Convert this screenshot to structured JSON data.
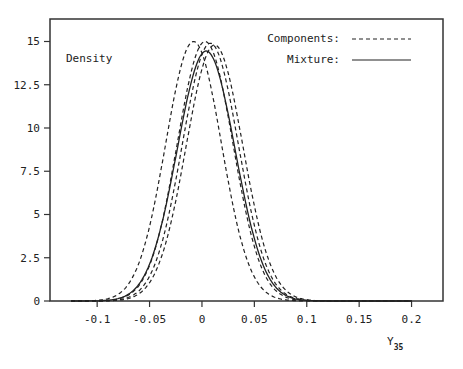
{
  "chart_data": {
    "type": "line",
    "title": "",
    "ylabel": "Density",
    "xlabel": "Y",
    "xlabel_subscript": "35",
    "xlim": [
      -0.145,
      0.23
    ],
    "ylim": [
      0,
      16.3
    ],
    "x_ticks": [
      -0.1,
      -0.05,
      0,
      0.05,
      0.1,
      0.15,
      0.2
    ],
    "x_tick_labels": [
      "-0.1",
      "-0.05",
      "0",
      "0.05",
      "0.1",
      "0.15",
      "0.2"
    ],
    "y_ticks": [
      0,
      2.5,
      5,
      7.5,
      10,
      12.5,
      15
    ],
    "y_tick_labels": [
      "0",
      "2.5",
      "5",
      "7.5",
      "10",
      "12.5",
      "15"
    ],
    "grid": false,
    "legend": {
      "position": "upper right",
      "entries": [
        {
          "label": "Components:",
          "style": "dashed"
        },
        {
          "label": "Mixture:",
          "style": "solid"
        }
      ]
    },
    "series": [
      {
        "name": "Component 1",
        "style": "dashed",
        "distribution": "normal",
        "mean": -0.008,
        "sd": 0.0266,
        "peak": 15.0
      },
      {
        "name": "Component 2",
        "style": "dashed",
        "distribution": "normal",
        "mean": 0.003,
        "sd": 0.0266,
        "peak": 15.0
      },
      {
        "name": "Component 3",
        "style": "dashed",
        "distribution": "normal",
        "mean": 0.008,
        "sd": 0.0268,
        "peak": 14.9
      },
      {
        "name": "Component 4",
        "style": "dashed",
        "distribution": "normal",
        "mean": 0.012,
        "sd": 0.027,
        "peak": 14.8
      },
      {
        "name": "Mixture",
        "style": "solid",
        "distribution": "normal",
        "mean": 0.004,
        "sd": 0.0276,
        "peak": 14.45
      }
    ]
  },
  "plot_area": {
    "left": 50,
    "top": 19,
    "right": 443,
    "bottom": 301
  },
  "colors": {
    "line": "#222222",
    "frame": "#333333"
  }
}
